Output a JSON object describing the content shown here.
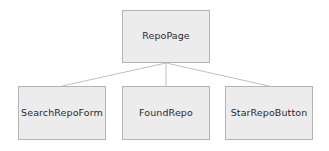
{
  "diagram": {
    "type": "tree",
    "title": "",
    "background_color": "#ffffff",
    "node_fill_color": "#ececec",
    "node_border_color": "#b4b4b4",
    "node_text_color": "#2b2b2b",
    "connector_color": "#b0b0b0",
    "root": {
      "id": "root",
      "label": "RepoPage"
    },
    "children": [
      {
        "id": "child-0",
        "label": "SearchRepoForm"
      },
      {
        "id": "child-1",
        "label": "FoundRepo"
      },
      {
        "id": "child-2",
        "label": "StarRepoButton"
      }
    ],
    "edges": [
      {
        "from": "RepoPage",
        "to": "SearchRepoForm"
      },
      {
        "from": "RepoPage",
        "to": "FoundRepo"
      },
      {
        "from": "RepoPage",
        "to": "StarRepoButton"
      }
    ]
  }
}
